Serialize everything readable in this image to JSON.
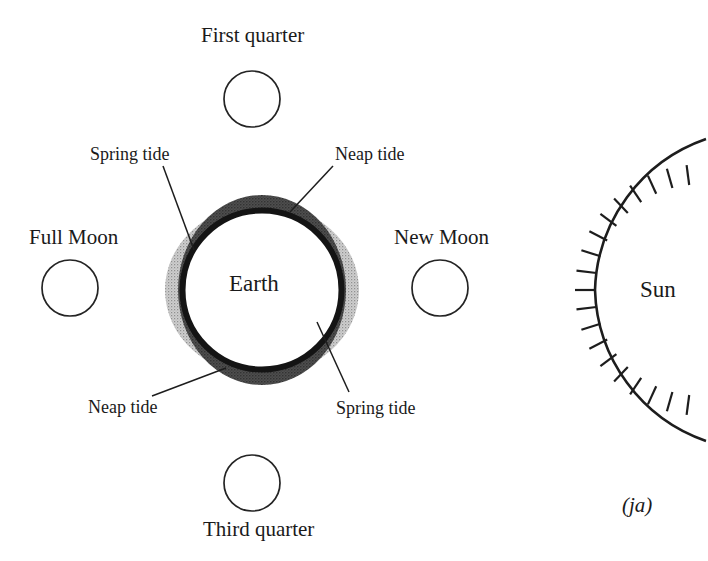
{
  "figure": {
    "caption": "(ja)",
    "central_body": "Earth",
    "external_body": "Sun"
  },
  "moon_phases": [
    {
      "id": "first-quarter",
      "label": "First quarter",
      "position": "top",
      "cx": 252,
      "cy": 99,
      "r": 28
    },
    {
      "id": "full-moon",
      "label": "Full Moon",
      "position": "left",
      "cx": 70,
      "cy": 288,
      "r": 28
    },
    {
      "id": "new-moon",
      "label": "New Moon",
      "position": "right",
      "cx": 440,
      "cy": 288,
      "r": 28
    },
    {
      "id": "third-quarter",
      "label": "Third quarter",
      "position": "bottom",
      "cx": 252,
      "cy": 483,
      "r": 28
    }
  ],
  "tide_labels": [
    {
      "id": "spring-tide-top",
      "label": "Spring tide",
      "corner": "top-left",
      "leader_from_x": 160,
      "leader_from_y": 163,
      "leader_to_x": 193,
      "leader_to_y": 248
    },
    {
      "id": "neap-tide-top",
      "label": "Neap tide",
      "corner": "top-right",
      "leader_from_x": 333,
      "leader_from_y": 164,
      "leader_to_x": 291,
      "leader_to_y": 212
    },
    {
      "id": "neap-tide-bottom",
      "label": "Neap tide",
      "corner": "bottom-left",
      "leader_from_x": 150,
      "leader_from_y": 395,
      "leader_to_x": 224,
      "leader_to_y": 368
    },
    {
      "id": "spring-tide-bottom",
      "label": "Spring tide",
      "corner": "bottom-right",
      "leader_from_x": 348,
      "leader_from_y": 392,
      "leader_to_x": 317,
      "leader_to_y": 323
    }
  ],
  "earth": {
    "label": "Earth",
    "cx": 262,
    "cy": 290,
    "inner_radius": 78,
    "ring_thickness": 6,
    "spring_bulge_radius": 96,
    "neap_bulge_radius": 93
  },
  "sun": {
    "label": "Sun",
    "arc_center_x": 760,
    "arc_center_y": 290,
    "arc_radius": 165,
    "ray_count": 19,
    "ray_length": 20
  },
  "colors": {
    "ink": "#1a1a1a",
    "outline": "#222222",
    "neap_bulge_fill": "#4a4a4a",
    "spring_bulge_fill": "#b9b9b9",
    "background": "#ffffff"
  }
}
